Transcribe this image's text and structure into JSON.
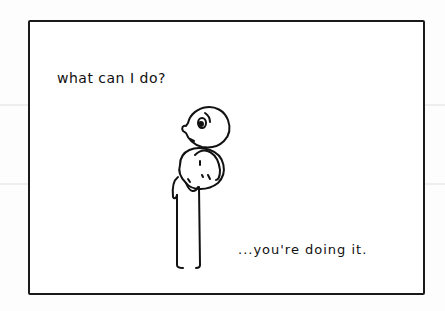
{
  "comic": {
    "caption_top": "what can I do?",
    "caption_bottom": "...you're doing it.",
    "figure": "stick-figure-hugging-another",
    "colors": {
      "ink": "#111111",
      "paper": "#ffffff",
      "border": "#1a1a1a"
    }
  }
}
